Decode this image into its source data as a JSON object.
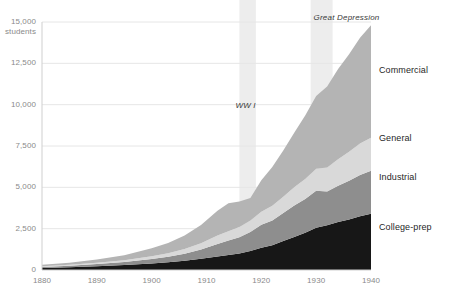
{
  "chart_data": {
    "type": "area",
    "stacked": true,
    "title": "",
    "subtitle": "",
    "xlabel": "",
    "ylabel": "students",
    "yunit_label": "students",
    "grid": true,
    "legend_position": "right-inline",
    "xlim": [
      1880,
      1940
    ],
    "ylim": [
      0,
      15000
    ],
    "xticks": [
      "1880",
      "1890",
      "1900",
      "1910",
      "1920",
      "1930",
      "1940"
    ],
    "xtick_values": [
      1880,
      1890,
      1900,
      1910,
      1920,
      1930,
      1940
    ],
    "yticks": [
      "0",
      "2,500",
      "5,000",
      "7,500",
      "10,000",
      "12,500",
      "15,000"
    ],
    "ytick_values": [
      0,
      2500,
      5000,
      7500,
      10000,
      12500,
      15000
    ],
    "x": [
      1880,
      1885,
      1890,
      1895,
      1900,
      1903,
      1906,
      1909,
      1912,
      1914,
      1916,
      1918,
      1920,
      1922,
      1924,
      1926,
      1928,
      1930,
      1932,
      1934,
      1936,
      1938,
      1940
    ],
    "series": [
      {
        "name": "College-prep",
        "color": "#171717",
        "values": [
          120,
          170,
          230,
          300,
          400,
          470,
          560,
          680,
          820,
          900,
          1000,
          1150,
          1350,
          1500,
          1750,
          2000,
          2250,
          2550,
          2700,
          2900,
          3050,
          3250,
          3400
        ]
      },
      {
        "name": "Industrial",
        "color": "#8e8e8e",
        "values": [
          60,
          90,
          130,
          180,
          260,
          330,
          420,
          560,
          760,
          880,
          980,
          1150,
          1380,
          1500,
          1700,
          1900,
          2050,
          2250,
          2050,
          2200,
          2350,
          2500,
          2600
        ]
      },
      {
        "name": "General",
        "color": "#d9d9d9",
        "values": [
          40,
          55,
          80,
          110,
          170,
          220,
          290,
          380,
          500,
          560,
          620,
          700,
          800,
          880,
          980,
          1100,
          1200,
          1320,
          1450,
          1600,
          1750,
          1900,
          2000
        ]
      },
      {
        "name": "Commercial",
        "color": "#b4b4b4",
        "values": [
          90,
          130,
          200,
          300,
          480,
          620,
          820,
          1100,
          1500,
          1700,
          1550,
          1350,
          1900,
          2350,
          2800,
          3300,
          3850,
          4400,
          4900,
          5450,
          5900,
          6400,
          6800
        ]
      }
    ],
    "annotations": [
      {
        "name": "WW I",
        "label": "WW I",
        "x_start": 1916,
        "x_end": 1919,
        "band_color": "#ededed"
      },
      {
        "name": "Great Depression",
        "label": "Great Depression",
        "x_start": 1929,
        "x_end": 1933,
        "band_color": "#ededed"
      }
    ]
  },
  "axes": {
    "y_top_label": "15,000\nstudents",
    "y_labels": [
      "12,500",
      "10,000",
      "7,500",
      "5,000",
      "2,500",
      "0"
    ],
    "x_labels": [
      "1880",
      "1890",
      "1900",
      "1910",
      "1920",
      "1930",
      "1940"
    ]
  },
  "series_labels": [
    {
      "label": "Commercial"
    },
    {
      "label": "General"
    },
    {
      "label": "Industrial"
    },
    {
      "label": "College-prep"
    }
  ],
  "annotation_labels": [
    {
      "label": "WW I"
    },
    {
      "label": "Great Depression"
    }
  ],
  "colors": {
    "college_prep": "#171717",
    "industrial": "#8e8e8e",
    "general": "#d9d9d9",
    "commercial": "#b4b4b4",
    "grid": "#e6e6e6",
    "axis_text": "#8a8a8a",
    "band": "#ededed",
    "background": "#ffffff"
  }
}
